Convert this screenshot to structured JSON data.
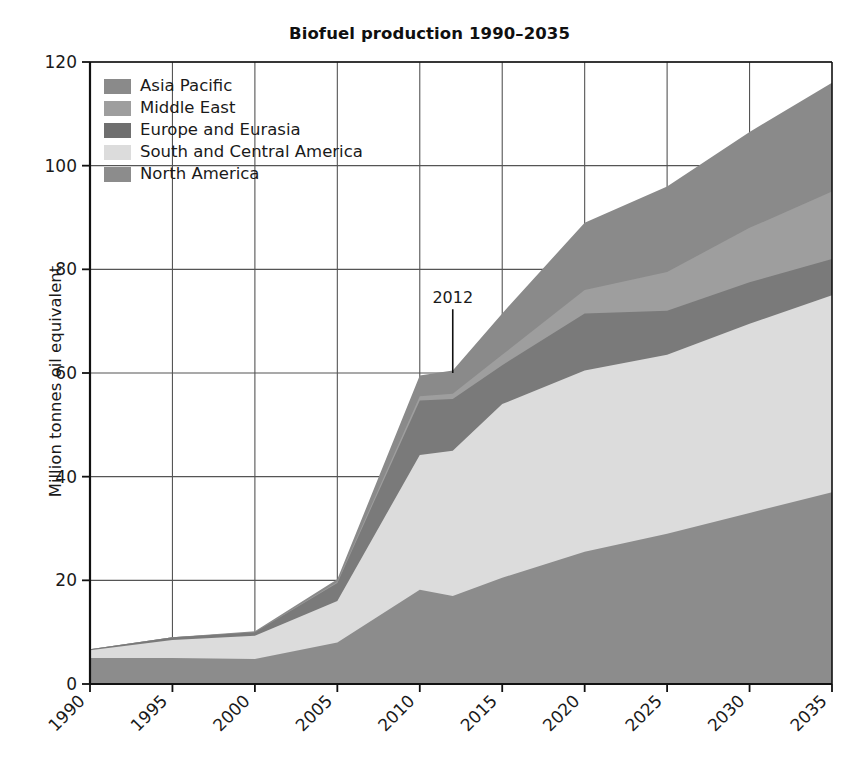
{
  "chart_data": {
    "type": "area",
    "stacked": true,
    "title": "Biofuel production 1990–2035",
    "xlabel": "",
    "ylabel": "Million tonnes oil equivalent",
    "xlim": [
      1990,
      2035
    ],
    "ylim": [
      0,
      120
    ],
    "ytick_labels": [
      "0",
      "20",
      "40",
      "60",
      "80",
      "100",
      "120"
    ],
    "yticks": [
      0,
      20,
      40,
      60,
      80,
      100,
      120
    ],
    "xtick_labels": [
      "1990",
      "1995",
      "2000",
      "2005",
      "2010",
      "2015",
      "2020",
      "2025",
      "2030",
      "2035"
    ],
    "xticks": [
      1990,
      1995,
      2000,
      2005,
      2010,
      2015,
      2020,
      2025,
      2030,
      2035
    ],
    "grid": true,
    "grid_axis": "both",
    "legend_position": "top-left",
    "x": [
      1990,
      1995,
      2000,
      2005,
      2010,
      2012,
      2015,
      2020,
      2025,
      2030,
      2035
    ],
    "stack_order_bottom_to_top": [
      "North America",
      "South and Central America",
      "Europe and Eurasia",
      "Middle East",
      "Asia Pacific"
    ],
    "series": [
      {
        "name": "North America",
        "color": "#8c8c8c",
        "values": [
          5.0,
          5.0,
          4.8,
          8.0,
          18.2,
          17.0,
          20.5,
          25.5,
          29.0,
          33.0,
          37.0
        ]
      },
      {
        "name": "South and Central America",
        "color": "#dcdcdc",
        "values": [
          1.5,
          3.5,
          4.5,
          8.0,
          26.0,
          28.0,
          33.5,
          35.0,
          34.5,
          36.5,
          38.0
        ]
      },
      {
        "name": "Europe and Eurasia",
        "color": "#7a7a7a",
        "values": [
          0.2,
          0.5,
          0.7,
          3.5,
          10.5,
          10.0,
          7.5,
          11.0,
          8.5,
          8.0,
          7.0
        ]
      },
      {
        "name": "Middle East",
        "color": "#9e9e9e",
        "values": [
          0.0,
          0.0,
          0.0,
          0.2,
          0.8,
          1.0,
          2.0,
          4.5,
          7.5,
          10.5,
          13.0
        ]
      },
      {
        "name": "Asia Pacific",
        "color": "#8a8a8a",
        "values": [
          0.0,
          0.0,
          0.2,
          0.5,
          4.0,
          4.5,
          8.0,
          13.0,
          16.5,
          18.5,
          21.0
        ]
      }
    ],
    "cumulative_totals": [
      6.7,
      9.0,
      10.2,
      20.2,
      59.5,
      60.5,
      71.5,
      89.0,
      96.0,
      106.5,
      116.0
    ],
    "annotations": [
      {
        "label": "2012",
        "x": 2012,
        "type": "year-marker",
        "line_top_value": 75,
        "line_bottom_value": 60
      }
    ]
  },
  "legend": {
    "items": [
      {
        "label": "Asia Pacific",
        "color": "#8a8a8a"
      },
      {
        "label": "Middle East",
        "color": "#9e9e9e"
      },
      {
        "label": "Europe and Eurasia",
        "color": "#6f6f6f"
      },
      {
        "label": "South and Central America",
        "color": "#dcdcdc"
      },
      {
        "label": "North America",
        "color": "#8c8c8c"
      }
    ]
  },
  "style": {
    "axis_color": "#111111",
    "grid_color": "#555555",
    "background": "#ffffff",
    "text_color": "#1a1a1a"
  }
}
